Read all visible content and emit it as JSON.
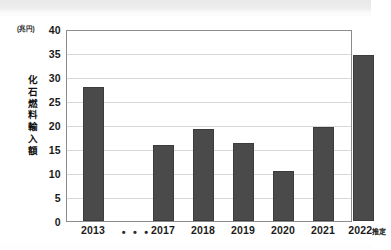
{
  "figure": {
    "unit_label": "(兆円)",
    "y_axis_title": "化石燃料輸入額",
    "ellipsis": "• • •",
    "bar_color": "#4a4a4a",
    "axis_color": "#8c8c8c",
    "grid_color": "#d8d8d8"
  },
  "chart_data": {
    "type": "bar",
    "title": "",
    "subtitle": "",
    "xlabel": "",
    "ylabel": "化石燃料輸入額",
    "unit": "兆円",
    "categories": [
      "2013",
      "2017",
      "2018",
      "2019",
      "2020",
      "2021",
      "2022推定"
    ],
    "values": [
      28.0,
      15.9,
      19.1,
      16.2,
      10.5,
      19.6,
      34.5
    ],
    "ylim": [
      0,
      40
    ],
    "yticks": [
      0,
      5,
      10,
      15,
      20,
      25,
      30,
      35,
      40
    ],
    "ytick_labels": [
      "0",
      "5",
      "10",
      "15",
      "20",
      "25",
      "30",
      "35",
      "40"
    ],
    "grid": true,
    "legend": false,
    "axis_break_marker": "• • •",
    "axis_break_between": [
      "2013",
      "2017"
    ]
  }
}
